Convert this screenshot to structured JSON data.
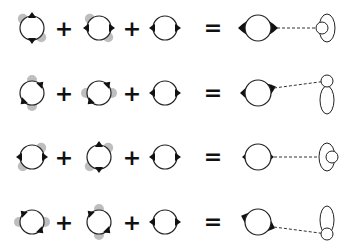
{
  "diagram": {
    "type": "orbital-combination-equations",
    "operators": {
      "plus": "+",
      "equals": "="
    },
    "colors": {
      "stroke": "#222222",
      "lobe_dark": "#111111",
      "lobe_light": "#a8a8a8",
      "background": "#ffffff",
      "dash": "#333333"
    },
    "rows": [
      {
        "y": 28,
        "terms": [
          {
            "x": 32,
            "dark_lobes": [
              "top",
              "bottom"
            ],
            "light_lobes": [
              "top-left",
              "bottom-right"
            ]
          },
          {
            "x": 99,
            "dark_lobes": [
              "left",
              "right"
            ],
            "light_lobes": [
              "top-left",
              "bottom-right"
            ]
          },
          {
            "x": 165,
            "dark_lobes": [
              "left",
              "right"
            ],
            "light_lobes": []
          }
        ],
        "result": {
          "x": 258,
          "lobes": [
            "left-large",
            "right-large"
          ],
          "line_end": [
            316,
            28
          ],
          "shape": "small-circle-inside-ellipse-left",
          "shape_x": 325,
          "shape_y": 28
        }
      },
      {
        "y": 93,
        "terms": [
          {
            "x": 32,
            "dark_lobes": [
              "top-right",
              "bottom-left"
            ],
            "light_lobes": [
              "top",
              "bottom"
            ]
          },
          {
            "x": 99,
            "dark_lobes": [
              "top-right",
              "bottom-left"
            ],
            "light_lobes": [
              "left",
              "right"
            ]
          },
          {
            "x": 165,
            "dark_lobes": [
              "left",
              "right"
            ],
            "light_lobes": []
          }
        ],
        "result": {
          "x": 258,
          "lobes": [
            "left",
            "right-up"
          ],
          "line_end": [
            327,
            81
          ],
          "shape": "small-circle-atop-ellipse",
          "shape_x": 327,
          "shape_y": 95
        }
      },
      {
        "y": 157,
        "terms": [
          {
            "x": 32,
            "dark_lobes": [
              "left",
              "right"
            ],
            "light_lobes": [
              "top-right",
              "bottom-left"
            ]
          },
          {
            "x": 99,
            "dark_lobes": [
              "top",
              "bottom"
            ],
            "light_lobes": [
              "top-right",
              "bottom-left"
            ]
          },
          {
            "x": 165,
            "dark_lobes": [
              "left",
              "right"
            ],
            "light_lobes": []
          }
        ],
        "result": {
          "x": 258,
          "lobes": [
            "left-small",
            "right-small"
          ],
          "line_end": [
            320,
            157
          ],
          "shape": "small-circle-right-of-ellipse",
          "shape_x": 327,
          "shape_y": 157
        }
      },
      {
        "y": 222,
        "terms": [
          {
            "x": 32,
            "dark_lobes": [
              "top-left",
              "bottom-right"
            ],
            "light_lobes": [
              "left",
              "right"
            ]
          },
          {
            "x": 99,
            "dark_lobes": [
              "top-left",
              "bottom-right"
            ],
            "light_lobes": [
              "top",
              "bottom"
            ]
          },
          {
            "x": 165,
            "dark_lobes": [
              "left",
              "right"
            ],
            "light_lobes": []
          }
        ],
        "result": {
          "x": 258,
          "lobes": [
            "left-up",
            "right-down"
          ],
          "line_end": [
            327,
            234
          ],
          "shape": "small-circle-below-ellipse",
          "shape_x": 327,
          "shape_y": 222
        }
      }
    ]
  }
}
